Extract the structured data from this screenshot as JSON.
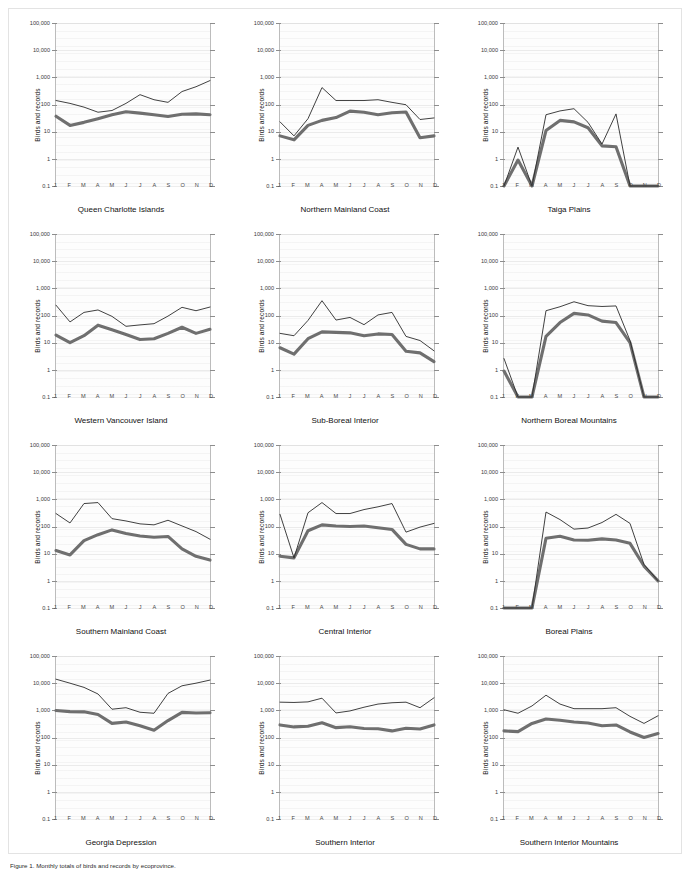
{
  "figure": {
    "ylabel": "Birds and records",
    "y_ticks": [
      "100,000",
      "10,000",
      "1,000",
      "100",
      "10",
      "1",
      "0.1"
    ],
    "x_ticks": [
      "J",
      "F",
      "M",
      "A",
      "M",
      "J",
      "J",
      "A",
      "S",
      "O",
      "N",
      "D"
    ],
    "caption": "Figure 1. Monthly totals of birds and records by ecoprovince."
  },
  "colors": {
    "thin_line": "#2b2b2b",
    "thick_line": "#6f6f6f",
    "plot_background": "#fdfdfd",
    "frame": "#e3e3e3",
    "axis": "#bcbcbc"
  },
  "chart_data": {
    "type": "line",
    "title": "",
    "xlabel": "",
    "ylabel": "Birds and records",
    "x": [
      "J",
      "F",
      "M",
      "A",
      "M",
      "J",
      "J",
      "A",
      "S",
      "O",
      "N",
      "D"
    ],
    "ylim": [
      0.1,
      100000
    ],
    "yscale": "log",
    "grid": true,
    "legend": "none",
    "panels": [
      {
        "title": "Queen Charlotte Islands",
        "series": [
          {
            "name": "records",
            "style": "thin",
            "values": [
              140,
              110,
              80,
              52,
              60,
              110,
              230,
              150,
              120,
              300,
              450,
              760
            ]
          },
          {
            "name": "birds",
            "style": "thick",
            "values": [
              37,
              17,
              22,
              30,
              42,
              54,
              48,
              42,
              36,
              44,
              45,
              42
            ]
          }
        ]
      },
      {
        "title": "Northern Mainland Coast",
        "series": [
          {
            "name": "records",
            "style": "thin",
            "values": [
              23,
              7,
              30,
              420,
              140,
              140,
              140,
              150,
              120,
              98,
              28,
              32
            ]
          },
          {
            "name": "birds",
            "style": "thick",
            "values": [
              7,
              5,
              17,
              26,
              33,
              57,
              52,
              42,
              50,
              53,
              6,
              7
            ]
          }
        ]
      },
      {
        "title": "Taiga Plains",
        "series": [
          {
            "name": "records",
            "style": "thin",
            "values": [
              0.1,
              2.7,
              0.1,
              42,
              58,
              70,
              22,
              3.5,
              45,
              0.1,
              0.1,
              0.1
            ]
          },
          {
            "name": "birds",
            "style": "thick",
            "values": [
              0.1,
              0.9,
              0.1,
              11,
              26,
              23,
              14,
              3,
              2.8,
              0.1,
              0.1,
              0.1
            ]
          }
        ]
      },
      {
        "title": "Western Vancouver Island",
        "series": [
          {
            "name": "records",
            "style": "thin",
            "values": [
              240,
              58,
              130,
              160,
              93,
              40,
              45,
              50,
              95,
              200,
              150,
              205
            ]
          },
          {
            "name": "birds",
            "style": "thick",
            "values": [
              19,
              10,
              18,
              44,
              30,
              20,
              13,
              14,
              22,
              37,
              22,
              31
            ]
          }
        ]
      },
      {
        "title": "Sub-Boreal Interior",
        "series": [
          {
            "name": "records",
            "style": "thin",
            "values": [
              22,
              18,
              66,
              350,
              68,
              85,
              46,
              105,
              130,
              17,
              12,
              5
            ]
          },
          {
            "name": "birds",
            "style": "thick",
            "values": [
              6.5,
              3.8,
              14,
              25,
              24,
              23,
              18,
              21,
              20,
              4.8,
              4.2,
              2
            ]
          }
        ]
      },
      {
        "title": "Northern Boreal Mountains",
        "series": [
          {
            "name": "records",
            "style": "thin",
            "values": [
              2.6,
              0.1,
              0.1,
              150,
              210,
              320,
              230,
              215,
              225,
              12,
              0.1,
              0.1
            ]
          },
          {
            "name": "birds",
            "style": "thick",
            "values": [
              0.9,
              0.1,
              0.1,
              17,
              55,
              120,
              105,
              62,
              55,
              10,
              0.1,
              0.1
            ]
          }
        ]
      },
      {
        "title": "Southern Mainland Coast",
        "series": [
          {
            "name": "records",
            "style": "thin",
            "values": [
              300,
              135,
              700,
              760,
              195,
              160,
              125,
              115,
              170,
              105,
              65,
              34
            ]
          },
          {
            "name": "birds",
            "style": "thick",
            "values": [
              13,
              9,
              30,
              50,
              75,
              55,
              45,
              40,
              43,
              15,
              8,
              5.8
            ]
          }
        ]
      },
      {
        "title": "Central Interior",
        "series": [
          {
            "name": "records",
            "style": "thin",
            "values": [
              280,
              7,
              320,
              760,
              300,
              300,
              420,
              530,
              700,
              62,
              95,
              130
            ]
          },
          {
            "name": "birds",
            "style": "thick",
            "values": [
              8,
              7,
              70,
              115,
              105,
              100,
              105,
              90,
              78,
              22,
              15,
              15
            ]
          }
        ]
      },
      {
        "title": "Boreal Plains",
        "series": [
          {
            "name": "records",
            "style": "thin",
            "values": [
              0.1,
              0.1,
              0.1,
              340,
              180,
              80,
              88,
              140,
              280,
              130,
              4,
              1
            ]
          },
          {
            "name": "birds",
            "style": "thick",
            "values": [
              0.1,
              0.1,
              0.1,
              37,
              44,
              32,
              31,
              35,
              32,
              24,
              3.5,
              1
            ]
          }
        ]
      },
      {
        "title": "Georgia Depression",
        "series": [
          {
            "name": "records",
            "style": "thin",
            "values": [
              14000,
              10000,
              7000,
              4000,
              1100,
              1250,
              850,
              780,
              4200,
              8000,
              10000,
              13000
            ]
          },
          {
            "name": "birds",
            "style": "thick",
            "values": [
              980,
              900,
              880,
              700,
              330,
              370,
              270,
              185,
              420,
              840,
              800,
              820
            ]
          }
        ]
      },
      {
        "title": "Southern Interior",
        "series": [
          {
            "name": "records",
            "style": "thin",
            "values": [
              2000,
              1950,
              2050,
              2800,
              800,
              950,
              1300,
              1700,
              1900,
              2000,
              1250,
              2900
            ]
          },
          {
            "name": "birds",
            "style": "thick",
            "values": [
              290,
              245,
              260,
              350,
              230,
              250,
              215,
              210,
              175,
              220,
              205,
              290
            ]
          }
        ]
      },
      {
        "title": "Southern Interior Mountains",
        "series": [
          {
            "name": "records",
            "style": "thin",
            "values": [
              1050,
              780,
              1450,
              3600,
              1700,
              1150,
              1150,
              1150,
              1250,
              600,
              330,
              630
            ]
          },
          {
            "name": "birds",
            "style": "thick",
            "values": [
              175,
              165,
              330,
              480,
              430,
              370,
              340,
              270,
              290,
              160,
              100,
              140
            ]
          }
        ]
      }
    ]
  }
}
